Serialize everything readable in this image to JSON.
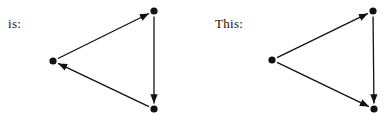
{
  "diagrams": [
    {
      "label": "is:",
      "label_pos": [
        8,
        16
      ],
      "nodes": [
        {
          "id": "top",
          "x": 154,
          "y": 11
        },
        {
          "id": "left",
          "x": 53,
          "y": 61
        },
        {
          "id": "bottom",
          "x": 154,
          "y": 109
        }
      ],
      "edges": [
        {
          "from": "left",
          "to": "top"
        },
        {
          "from": "top",
          "to": "bottom"
        },
        {
          "from": "bottom",
          "to": "left"
        }
      ]
    },
    {
      "label": "This:",
      "label_pos": [
        215,
        16
      ],
      "nodes": [
        {
          "id": "top",
          "x": 373,
          "y": 11
        },
        {
          "id": "left",
          "x": 272,
          "y": 60
        },
        {
          "id": "bottom",
          "x": 374,
          "y": 109
        }
      ],
      "edges": [
        {
          "from": "left",
          "to": "top"
        },
        {
          "from": "left",
          "to": "bottom"
        },
        {
          "from": "top",
          "to": "bottom"
        }
      ]
    }
  ],
  "colors": {
    "ink": "#111111",
    "background": "#ffffff"
  }
}
